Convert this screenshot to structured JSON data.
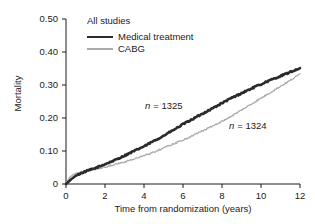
{
  "panel": {
    "title": "All studies"
  },
  "axes": {
    "ylabel": "Mortality",
    "xlabel": "Time from randomization (years)",
    "yticks": [
      "0.50",
      "0.40",
      "0.30",
      "0.20",
      "0.10",
      "0"
    ],
    "xticks": [
      "0",
      "2",
      "4",
      "6",
      "8",
      "10",
      "12"
    ]
  },
  "legend": {
    "items": [
      {
        "label": "Medical treatment",
        "color": "#2b2b2b",
        "style": "thick"
      },
      {
        "label": "CABG",
        "color": "#aaaaaa",
        "style": "thin"
      }
    ]
  },
  "annotations": [
    {
      "id": "medical",
      "text": "n = 1325",
      "prefix": "n",
      "value": "= 1325"
    },
    {
      "id": "cabg",
      "text": "n = 1324",
      "prefix": "n",
      "value": "= 1324"
    }
  ],
  "chart_data": {
    "type": "line",
    "title": "All studies",
    "xlabel": "Time from randomization (years)",
    "ylabel": "Mortality",
    "xlim": [
      0,
      12
    ],
    "ylim": [
      0,
      0.5
    ],
    "xticks": [
      0,
      2,
      4,
      6,
      8,
      10,
      12
    ],
    "yticks": [
      0,
      0.1,
      0.2,
      0.3,
      0.4,
      0.5
    ],
    "grid": false,
    "legend_position": "top-left",
    "annotations": [
      {
        "text": "n = 1325",
        "x": 4.6,
        "y": 0.235,
        "series": "Medical treatment"
      },
      {
        "text": "n = 1324",
        "x": 8.9,
        "y": 0.175,
        "series": "CABG"
      }
    ],
    "series": [
      {
        "name": "Medical treatment",
        "color": "#2b2b2b",
        "linewidth": 2.6,
        "n": 1325,
        "x": [
          0,
          0.15,
          0.3,
          0.5,
          0.75,
          1.0,
          1.25,
          1.5,
          1.75,
          2.0,
          2.25,
          2.5,
          2.75,
          3.0,
          3.25,
          3.5,
          3.75,
          4.0,
          4.25,
          4.5,
          4.75,
          5.0,
          5.25,
          5.5,
          5.75,
          6.0,
          6.25,
          6.5,
          6.75,
          7.0,
          7.25,
          7.5,
          7.75,
          8.0,
          8.25,
          8.5,
          8.75,
          9.0,
          9.25,
          9.5,
          9.75,
          10.0,
          10.25,
          10.5,
          10.75,
          11.0,
          11.25,
          11.5,
          11.75,
          12.0
        ],
        "y": [
          0.0,
          0.008,
          0.016,
          0.025,
          0.032,
          0.038,
          0.043,
          0.048,
          0.054,
          0.06,
          0.066,
          0.072,
          0.079,
          0.086,
          0.093,
          0.1,
          0.107,
          0.114,
          0.122,
          0.13,
          0.138,
          0.146,
          0.155,
          0.163,
          0.172,
          0.181,
          0.189,
          0.197,
          0.205,
          0.213,
          0.221,
          0.229,
          0.237,
          0.245,
          0.253,
          0.261,
          0.268,
          0.275,
          0.282,
          0.289,
          0.296,
          0.302,
          0.309,
          0.315,
          0.321,
          0.327,
          0.333,
          0.339,
          0.345,
          0.351
        ]
      },
      {
        "name": "CABG",
        "color": "#aaaaaa",
        "linewidth": 1.3,
        "n": 1324,
        "x": [
          0,
          0.1,
          0.2,
          0.35,
          0.5,
          0.75,
          1.0,
          1.25,
          1.5,
          1.75,
          2.0,
          2.25,
          2.5,
          2.75,
          3.0,
          3.25,
          3.5,
          3.75,
          4.0,
          4.25,
          4.5,
          4.75,
          5.0,
          5.25,
          5.5,
          5.75,
          6.0,
          6.25,
          6.5,
          6.75,
          7.0,
          7.25,
          7.5,
          7.75,
          8.0,
          8.25,
          8.5,
          8.75,
          9.0,
          9.25,
          9.5,
          9.75,
          10.0,
          10.25,
          10.5,
          10.75,
          11.0,
          11.25,
          11.5,
          11.75,
          12.0
        ],
        "y": [
          0.0,
          0.012,
          0.021,
          0.028,
          0.032,
          0.036,
          0.039,
          0.042,
          0.045,
          0.048,
          0.051,
          0.055,
          0.059,
          0.063,
          0.067,
          0.071,
          0.076,
          0.081,
          0.086,
          0.091,
          0.097,
          0.103,
          0.109,
          0.115,
          0.121,
          0.127,
          0.133,
          0.14,
          0.147,
          0.154,
          0.161,
          0.168,
          0.175,
          0.182,
          0.19,
          0.198,
          0.206,
          0.215,
          0.224,
          0.233,
          0.242,
          0.251,
          0.26,
          0.269,
          0.278,
          0.287,
          0.296,
          0.305,
          0.314,
          0.323,
          0.334
        ]
      }
    ]
  }
}
